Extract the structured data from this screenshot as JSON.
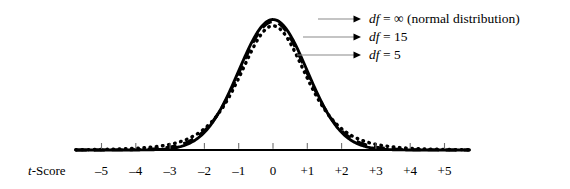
{
  "chart_data": {
    "type": "line",
    "title": "",
    "subtitle": "",
    "xlabel": "t-Score",
    "ylabel": "",
    "xlim": [
      -5.8,
      5.8
    ],
    "ylim": [
      0,
      0.4
    ],
    "grid": false,
    "legend_position": "upper-right-callout",
    "x_tick_labels": [
      "–5",
      "–4",
      "–3",
      "–2",
      "–1",
      "0",
      "+1",
      "+2",
      "+3",
      "+4",
      "+5"
    ],
    "x_tick_values": [
      -5,
      -4,
      -3,
      -2,
      -1,
      0,
      1,
      2,
      3,
      4,
      5
    ],
    "series": [
      {
        "name": "df = ∞ (normal distribution)",
        "df": "infinity",
        "line_style": "solid",
        "color": "#000000",
        "peak_value": 0.3989
      },
      {
        "name": "df = 15",
        "df": 15,
        "line_style": "dashed",
        "color": "#000000",
        "peak_value": 0.3879
      },
      {
        "name": "df = 5",
        "df": 5,
        "line_style": "dotted",
        "color": "#000000",
        "peak_value": 0.3796
      }
    ],
    "annotations": [
      "df = ∞ (normal distribution)",
      "df = 15",
      "df = 5"
    ]
  },
  "axis": {
    "title_prefix": "t",
    "title_suffix": "-Score"
  },
  "legend": {
    "items": [
      {
        "df_label": "df",
        "equals": " = ",
        "value": "∞ (normal distribution)"
      },
      {
        "df_label": "df",
        "equals": " = ",
        "value": "15"
      },
      {
        "df_label": "df",
        "equals": " = ",
        "value": "5"
      }
    ]
  },
  "colors": {
    "curve": "#000000",
    "axis": "#000000",
    "leader_line": "#8a8a8a",
    "background": "#ffffff"
  }
}
